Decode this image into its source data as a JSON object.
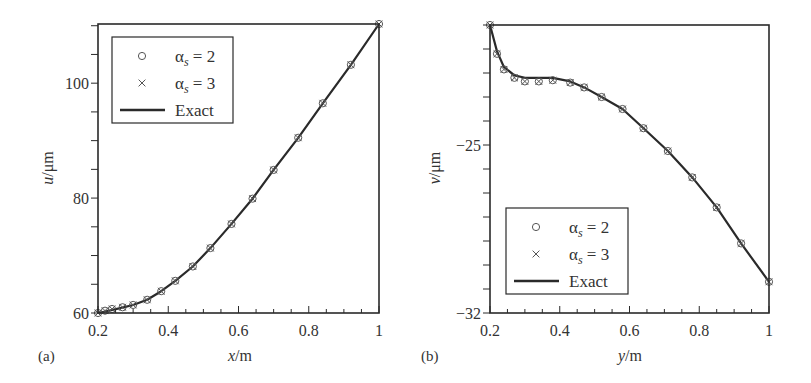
{
  "chart_data": [
    {
      "id": "a",
      "type": "line",
      "panel_label": "(a)",
      "xlabel_var": "x",
      "xlabel_unit": "/m",
      "ylabel_var": "u",
      "ylabel_unit": "/μm",
      "xlim": [
        0.2,
        1.0
      ],
      "ylim": [
        60,
        110.3
      ],
      "xticks": [
        0.2,
        0.4,
        0.6,
        0.8,
        1.0
      ],
      "xtick_labels": [
        "0.2",
        "0.4",
        "0.6",
        "0.8",
        "1"
      ],
      "x_minor_step": 0.05,
      "yticks": [
        60,
        80,
        100
      ],
      "ytick_labels": [
        "60",
        "80",
        "100"
      ],
      "y_minor_step": 5,
      "grid": false,
      "legend_position": "upper left",
      "legend": [
        {
          "marker": "circle",
          "label_base": "α",
          "label_sub": "s",
          "label_rest": " = 2"
        },
        {
          "marker": "cross",
          "label_base": "α",
          "label_sub": "s",
          "label_rest": " = 3"
        },
        {
          "marker": "line",
          "label_base": "Exact",
          "label_sub": "",
          "label_rest": ""
        }
      ],
      "series": [
        {
          "name": "Exact",
          "style": "line",
          "x": [
            0.2,
            0.23,
            0.26,
            0.3,
            0.34,
            0.38,
            0.42,
            0.47,
            0.52,
            0.58,
            0.64,
            0.7,
            0.77,
            0.84,
            0.92,
            1.0
          ],
          "y": [
            60.0,
            60.4,
            60.8,
            61.4,
            62.3,
            63.8,
            65.6,
            68.1,
            71.3,
            75.5,
            79.9,
            84.9,
            90.5,
            96.5,
            103.2,
            110.3
          ]
        },
        {
          "name": "αs = 2",
          "style": "circle",
          "x": [
            0.2,
            0.22,
            0.24,
            0.27,
            0.3,
            0.34,
            0.38,
            0.42,
            0.47,
            0.52,
            0.58,
            0.64,
            0.7,
            0.77,
            0.84,
            0.92,
            1.0
          ],
          "y": [
            60.0,
            60.4,
            60.7,
            61.0,
            61.4,
            62.3,
            63.8,
            65.6,
            68.1,
            71.3,
            75.5,
            79.9,
            84.9,
            90.5,
            96.5,
            103.2,
            110.3
          ]
        },
        {
          "name": "αs = 3",
          "style": "cross",
          "x": [
            0.2,
            0.22,
            0.24,
            0.27,
            0.3,
            0.34,
            0.38,
            0.42,
            0.47,
            0.52,
            0.58,
            0.64,
            0.7,
            0.77,
            0.84,
            0.92,
            1.0
          ],
          "y": [
            60.0,
            60.4,
            60.7,
            61.0,
            61.4,
            62.3,
            63.8,
            65.6,
            68.1,
            71.3,
            75.5,
            79.9,
            84.9,
            90.5,
            96.5,
            103.2,
            110.3
          ]
        }
      ]
    },
    {
      "id": "b",
      "type": "line",
      "panel_label": "(b)",
      "xlabel_var": "y",
      "xlabel_unit": "/m",
      "ylabel_var": "v",
      "ylabel_unit": "/μm",
      "xlim": [
        0.2,
        1.0
      ],
      "ylim": [
        -32,
        -20
      ],
      "xticks": [
        0.2,
        0.4,
        0.6,
        0.8,
        1.0
      ],
      "xtick_labels": [
        "0.2",
        "0.4",
        "0.6",
        "0.8",
        "1"
      ],
      "x_minor_step": 0.05,
      "yticks": [
        -32,
        -25
      ],
      "ytick_labels": [
        "−32",
        "−25"
      ],
      "y_minor_step": 1,
      "grid": false,
      "legend_position": "lower left",
      "legend": [
        {
          "marker": "circle",
          "label_base": "α",
          "label_sub": "s",
          "label_rest": " = 2"
        },
        {
          "marker": "cross",
          "label_base": "α",
          "label_sub": "s",
          "label_rest": " = 3"
        },
        {
          "marker": "line",
          "label_base": "Exact",
          "label_sub": "",
          "label_rest": ""
        }
      ],
      "series": [
        {
          "name": "Exact",
          "style": "line",
          "x": [
            0.2,
            0.22,
            0.24,
            0.27,
            0.3,
            0.34,
            0.38,
            0.43,
            0.47,
            0.52,
            0.58,
            0.64,
            0.71,
            0.78,
            0.85,
            0.92,
            1.0
          ],
          "y": [
            -20.0,
            -21.1,
            -21.75,
            -22.1,
            -22.2,
            -22.2,
            -22.2,
            -22.35,
            -22.6,
            -23.0,
            -23.5,
            -24.3,
            -25.25,
            -26.35,
            -27.6,
            -29.1,
            -30.7
          ]
        },
        {
          "name": "αs = 2",
          "style": "circle",
          "x": [
            0.2,
            0.22,
            0.24,
            0.27,
            0.3,
            0.34,
            0.38,
            0.43,
            0.47,
            0.52,
            0.58,
            0.64,
            0.71,
            0.78,
            0.85,
            0.92,
            1.0
          ],
          "y": [
            -20.0,
            -21.2,
            -21.85,
            -22.2,
            -22.35,
            -22.35,
            -22.3,
            -22.4,
            -22.6,
            -23.0,
            -23.5,
            -24.3,
            -25.25,
            -26.35,
            -27.6,
            -29.1,
            -30.7
          ]
        },
        {
          "name": "αs = 3",
          "style": "cross",
          "x": [
            0.2,
            0.22,
            0.24,
            0.27,
            0.3,
            0.34,
            0.38,
            0.43,
            0.47,
            0.52,
            0.58,
            0.64,
            0.71,
            0.78,
            0.85,
            0.92,
            1.0
          ],
          "y": [
            -20.0,
            -21.2,
            -21.85,
            -22.2,
            -22.35,
            -22.35,
            -22.3,
            -22.4,
            -22.6,
            -23.0,
            -23.5,
            -24.3,
            -25.25,
            -26.35,
            -27.6,
            -29.1,
            -30.7
          ]
        }
      ]
    }
  ],
  "colors": {
    "ink": "#2a2a2a",
    "marker": "#555555",
    "background": "#ffffff"
  }
}
